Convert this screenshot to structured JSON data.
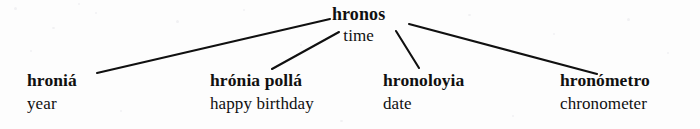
{
  "figure": {
    "type": "word-family-tree",
    "background_color": "#fdfdfd",
    "ink_color": "#101010",
    "root": {
      "term": "hronos",
      "gloss": "time"
    },
    "leaves": [
      {
        "term": "hroniá",
        "gloss": "year"
      },
      {
        "term": "hrónia pollá",
        "gloss": "happy birthday"
      },
      {
        "term": "hronoloyia",
        "gloss": "date"
      },
      {
        "term": "hronómetro",
        "gloss": "chronometer"
      }
    ],
    "connectors": [
      {
        "name": "root-to-hronia",
        "x1": 330,
        "y1": 19,
        "x2": 97,
        "y2": 73
      },
      {
        "name": "root-to-hronia-polla",
        "x1": 339,
        "y1": 32,
        "x2": 272,
        "y2": 69
      },
      {
        "name": "root-to-hronoloyia",
        "x1": 396,
        "y1": 31,
        "x2": 419,
        "y2": 68
      },
      {
        "name": "root-to-hronometro",
        "x1": 409,
        "y1": 24,
        "x2": 597,
        "y2": 74
      }
    ]
  }
}
